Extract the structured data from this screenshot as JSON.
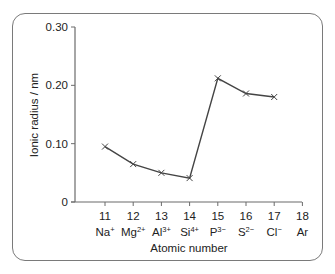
{
  "chart_data": {
    "type": "line",
    "title": "",
    "xlabel": "Atomic number",
    "ylabel": "Ionic radius / nm",
    "x": [
      11,
      12,
      13,
      14,
      15,
      16,
      17
    ],
    "x_ticks": [
      11,
      12,
      13,
      14,
      15,
      16,
      17,
      18
    ],
    "x_tick_ions": [
      {
        "base": "Na",
        "charge": "+"
      },
      {
        "base": "Mg",
        "charge": "2+"
      },
      {
        "base": "Al",
        "charge": "3+"
      },
      {
        "base": "Si",
        "charge": "4+"
      },
      {
        "base": "P",
        "charge": "3−"
      },
      {
        "base": "S",
        "charge": "2−"
      },
      {
        "base": "Cl",
        "charge": "−"
      },
      {
        "base": "Ar",
        "charge": ""
      }
    ],
    "series": [
      {
        "name": "Ionic radius",
        "marker": "x",
        "values": [
          0.095,
          0.065,
          0.05,
          0.041,
          0.212,
          0.186,
          0.18
        ]
      }
    ],
    "y_ticks": [
      "0",
      "0.10",
      "0.20",
      "0.30"
    ],
    "ylim": [
      0,
      0.3
    ],
    "xlim": [
      10.0,
      18
    ],
    "grid": false,
    "legend": null
  }
}
